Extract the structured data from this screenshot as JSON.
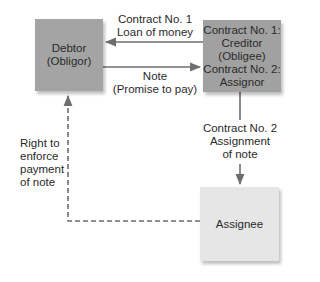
{
  "diagram": {
    "nodes": {
      "debtor": {
        "label": "Debtor\n(Obligor)"
      },
      "creditor": {
        "label": "Contract No. 1:\nCreditor\n(Obligee)\nContract No. 2:\nAssignor"
      },
      "assignee": {
        "label": "Assignee"
      }
    },
    "edges": {
      "loan": {
        "label": "Contract No. 1\nLoan of money",
        "from": "creditor",
        "to": "debtor",
        "style": "solid"
      },
      "note": {
        "label": "Note\n(Promise to pay)",
        "from": "debtor",
        "to": "creditor",
        "style": "solid"
      },
      "assignment": {
        "label": "Contract No. 2\nAssignment\nof note",
        "from": "creditor",
        "to": "assignee",
        "style": "solid"
      },
      "right": {
        "label": "Right to\nenforce\npayment\nof note",
        "from": "assignee",
        "to": "debtor",
        "style": "dashed"
      }
    },
    "colors": {
      "debtor_fill": "#a4a4a4",
      "creditor_fill": "#a1a1a1",
      "assignee_fill": "#e6e6e6",
      "line": "#6e6e6e"
    }
  }
}
